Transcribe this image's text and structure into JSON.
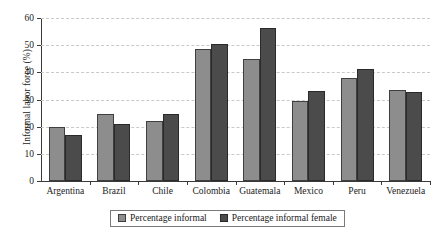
{
  "chart_data": {
    "type": "bar",
    "title": "",
    "xlabel": "",
    "ylabel": "Informal labor force (%)",
    "ylim": [
      0,
      60
    ],
    "yticks": [
      0,
      10,
      20,
      30,
      40,
      50,
      60
    ],
    "grid": true,
    "legend_position": "bottom",
    "categories": [
      "Argentina",
      "Brazil",
      "Chile",
      "Colombia",
      "Guatemala",
      "Mexico",
      "Peru",
      "Venezuela"
    ],
    "series": [
      {
        "name": "Percentage informal",
        "color": "#8d8d8d",
        "values": [
          20.0,
          24.8,
          22.0,
          48.5,
          45.0,
          29.3,
          38.0,
          33.5
        ]
      },
      {
        "name": "Percentage informal female",
        "color": "#4b4b4b",
        "values": [
          16.8,
          21.0,
          24.8,
          50.5,
          56.2,
          33.0,
          41.4,
          32.8
        ]
      }
    ]
  }
}
